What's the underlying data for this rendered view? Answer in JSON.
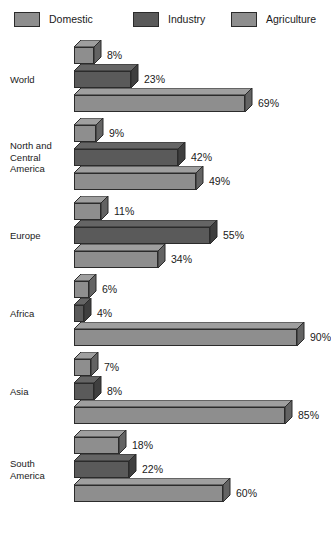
{
  "legend": {
    "items": [
      {
        "label": "Domestic",
        "color": "#8e8e8e"
      },
      {
        "label": "Industry",
        "color": "#5a5a5a"
      },
      {
        "label": "Agriculture",
        "color": "#8e8e8e"
      }
    ]
  },
  "chart_data": {
    "type": "bar",
    "orientation": "horizontal",
    "title": "",
    "subtitle": "",
    "xlabel": "",
    "ylabel": "",
    "xlim": [
      0,
      100
    ],
    "unit": "%",
    "grid": false,
    "legend_position": "top",
    "categories": [
      "World",
      "North and Central America",
      "Europe",
      "Africa",
      "Asia",
      "South America"
    ],
    "category_display": [
      [
        "World"
      ],
      [
        "North and",
        "Central",
        "America"
      ],
      [
        "Europe"
      ],
      [
        "Africa"
      ],
      [
        "Asia"
      ],
      [
        "South",
        "America"
      ]
    ],
    "series": [
      {
        "name": "Domestic",
        "color": "#8e8e8e",
        "values": [
          8,
          9,
          11,
          6,
          7,
          18
        ]
      },
      {
        "name": "Industry",
        "color": "#5a5a5a",
        "values": [
          23,
          42,
          55,
          4,
          8,
          22
        ]
      },
      {
        "name": "Agriculture",
        "color": "#8e8e8e",
        "values": [
          69,
          49,
          34,
          90,
          85,
          60
        ]
      }
    ],
    "value_labels": [
      [
        "8%",
        "23%",
        "69%"
      ],
      [
        "9%",
        "42%",
        "49%"
      ],
      [
        "11%",
        "55%",
        "34%"
      ],
      [
        "6%",
        "4%",
        "90%"
      ],
      [
        "7%",
        "8%",
        "85%"
      ],
      [
        "18%",
        "22%",
        "60%"
      ]
    ]
  }
}
